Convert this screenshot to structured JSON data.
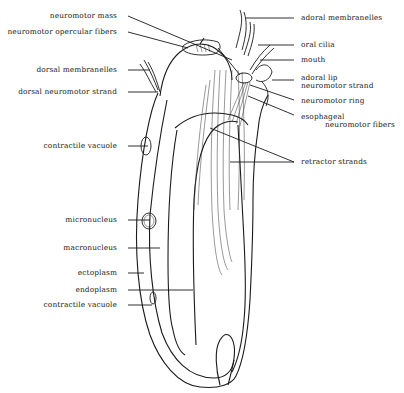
{
  "diagram": {
    "labels_left": [
      {
        "id": "neuromotor-mass",
        "text": "neuromotor mass"
      },
      {
        "id": "neuromotor-opercular-fibers",
        "text": "neuromotor opercular fibers"
      },
      {
        "id": "dorsal-membranelles",
        "text": "dorsal membranelles"
      },
      {
        "id": "dorsal-neuromotor-strand",
        "text": "dorsal neuromotor strand"
      },
      {
        "id": "contractile-vacuole-upper",
        "text": "contractile vacuole"
      },
      {
        "id": "micronucleus",
        "text": "micronucleus"
      },
      {
        "id": "macronucleus",
        "text": "macronucleus"
      },
      {
        "id": "ectoplasm",
        "text": "ectoplasm"
      },
      {
        "id": "endoplasm",
        "text": "endoplasm"
      },
      {
        "id": "contractile-vacuole-lower",
        "text": "contractile vacuole"
      }
    ],
    "labels_right": [
      {
        "id": "adoral-membranelles",
        "text": "adoral membranelles"
      },
      {
        "id": "oral-cilia",
        "text": "oral cilia"
      },
      {
        "id": "mouth",
        "text": "mouth"
      },
      {
        "id": "adoral-lip",
        "text": "adoral lip"
      },
      {
        "id": "neuromotor-strand",
        "text": "neuromotor strand"
      },
      {
        "id": "neuromotor-ring",
        "text": "neuromotor ring"
      },
      {
        "id": "esophageal",
        "text": "esophageal"
      },
      {
        "id": "esophageal-fibers",
        "text": "neuromotor fibers"
      },
      {
        "id": "retractor-strands",
        "text": "retractor strands"
      }
    ]
  }
}
